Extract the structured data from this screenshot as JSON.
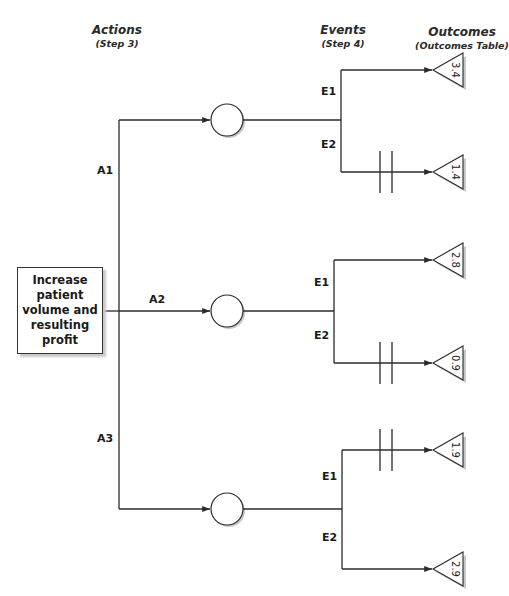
{
  "headers": {
    "actions": {
      "title": "Actions",
      "subtitle": "(Step 3)"
    },
    "events": {
      "title": "Events",
      "subtitle": "(Step 4)"
    },
    "outcomes": {
      "title": "Outcomes",
      "subtitle": "(Outcomes Table)"
    }
  },
  "root": {
    "label": "Increase patient volume and resulting profit"
  },
  "actions": [
    {
      "label": "A1",
      "y": 120,
      "branch_x": 341,
      "events": [
        {
          "label": "E1",
          "y": 70,
          "outcome": "3.4",
          "blocked": false
        },
        {
          "label": "E2",
          "y": 172,
          "outcome": "1.4",
          "blocked": true
        }
      ]
    },
    {
      "label": "A2",
      "y": 311,
      "branch_x": 334,
      "events": [
        {
          "label": "E1",
          "y": 260,
          "outcome": "2.8",
          "blocked": false
        },
        {
          "label": "E2",
          "y": 363,
          "outcome": "0.9",
          "blocked": true
        }
      ]
    },
    {
      "label": "A3",
      "y": 509,
      "branch_x": 342,
      "events": [
        {
          "label": "E1",
          "y": 450,
          "outcome": "1.9",
          "blocked": true
        },
        {
          "label": "E2",
          "y": 569,
          "outcome": "2.9",
          "blocked": false
        }
      ]
    }
  ],
  "colors": {
    "line": "#2b2b2b",
    "shadow": "#c8c8c8"
  }
}
